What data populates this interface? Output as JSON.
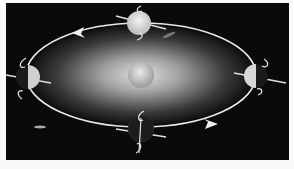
{
  "figure": {
    "colors": {
      "background": "#0a0a0a",
      "page": "#fafafa",
      "orbit": "#e8e8e8",
      "sun": "#c8c8c8",
      "glow": "#d0d0d0"
    },
    "sun": {
      "cx": 135,
      "cy": 72,
      "r": 13
    },
    "orbit": {
      "cx": 135,
      "cy": 72,
      "rx": 115,
      "ry": 52
    },
    "earths": [
      {
        "name": "top",
        "cx": 133,
        "cy": 20,
        "lit": "full"
      },
      {
        "name": "right",
        "cx": 250,
        "cy": 73,
        "lit": "half-left"
      },
      {
        "name": "bottom",
        "cx": 135,
        "cy": 126,
        "lit": "dark"
      },
      {
        "name": "left",
        "cx": 22,
        "cy": 74,
        "lit": "half-right"
      }
    ],
    "arrows": [
      {
        "position": "top-left",
        "x": 72,
        "y": 29,
        "direction": "left"
      },
      {
        "position": "bottom-right",
        "x": 205,
        "y": 122,
        "direction": "right"
      }
    ]
  }
}
